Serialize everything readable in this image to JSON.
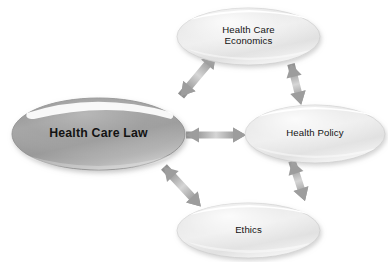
{
  "diagram": {
    "background_color": "#ffffff",
    "width": 388,
    "height": 262,
    "nodes": [
      {
        "id": "health-care-law",
        "label": "Health Care Law",
        "shape": "ellipse",
        "emphasis": "primary",
        "fill_color": "#9d9d9d",
        "text_color": "#131313",
        "font_weight": "bold",
        "cx": 98.5,
        "cy": 134,
        "rx": 86.5,
        "ry": 36
      },
      {
        "id": "health-care-economics",
        "label": "Health Care\nEconomics",
        "shape": "ellipse",
        "emphasis": "secondary",
        "fill_color": "#e6e6e6",
        "text_color": "#131313",
        "font_weight": "normal",
        "cx": 248.5,
        "cy": 36.5,
        "rx": 71.5,
        "ry": 28.5
      },
      {
        "id": "health-policy",
        "label": "Health Policy",
        "shape": "ellipse",
        "emphasis": "secondary",
        "fill_color": "#e6e6e6",
        "text_color": "#131313",
        "font_weight": "normal",
        "cx": 315,
        "cy": 134,
        "rx": 70,
        "ry": 29
      },
      {
        "id": "ethics",
        "label": "Ethics",
        "shape": "ellipse",
        "emphasis": "secondary",
        "fill_color": "#e6e6e6",
        "text_color": "#131313",
        "font_weight": "normal",
        "cx": 248.5,
        "cy": 230.5,
        "rx": 71.5,
        "ry": 27.5
      }
    ],
    "connectors": [
      {
        "id": "law-to-economics",
        "from": "health-care-law",
        "to": "health-care-economics",
        "style": "double-headed-arrow",
        "color": "#9a9a9a",
        "orientation": "diagonal-up-right"
      },
      {
        "id": "law-to-policy",
        "from": "health-care-law",
        "to": "health-policy",
        "style": "double-headed-arrow",
        "color": "#9a9a9a",
        "orientation": "horizontal"
      },
      {
        "id": "law-to-ethics",
        "from": "health-care-law",
        "to": "ethics",
        "style": "double-headed-arrow",
        "color": "#9a9a9a",
        "orientation": "diagonal-down-right"
      },
      {
        "id": "economics-to-policy",
        "from": "health-care-economics",
        "to": "health-policy",
        "style": "double-headed-arrow",
        "color": "#9a9a9a",
        "orientation": "vertical"
      },
      {
        "id": "policy-to-ethics",
        "from": "health-policy",
        "to": "ethics",
        "style": "double-headed-arrow",
        "color": "#9a9a9a",
        "orientation": "vertical"
      }
    ]
  }
}
